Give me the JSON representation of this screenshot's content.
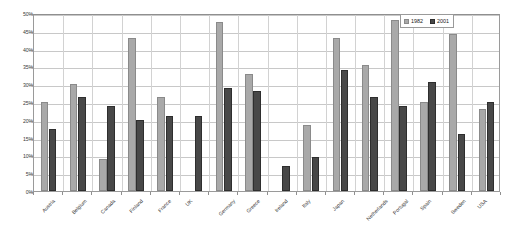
{
  "chart_data": {
    "type": "bar",
    "title": "",
    "subtitle": "",
    "xlabel": "",
    "ylabel": "",
    "ylim": [
      0,
      50
    ],
    "ytick_step": 5,
    "ytick_labels": [
      "0%",
      "5%",
      "10%",
      "15%",
      "20%",
      "25%",
      "30%",
      "35%",
      "40%",
      "45%",
      "50%"
    ],
    "grid": true,
    "legend_position": "top-right",
    "categories": [
      "Austria",
      "Belgium",
      "Canada",
      "Finland",
      "France",
      "UK",
      "Germany",
      "Greece",
      "Ireland",
      "Italy",
      "Japan",
      "Netherlands",
      "Portugal",
      "Spain",
      "Sweden",
      "USA"
    ],
    "series": [
      {
        "name": "1982",
        "color": "#a9a9a9",
        "values": [
          25,
          30,
          9,
          43,
          26.5,
          null,
          47.5,
          33,
          null,
          18.5,
          43,
          35.5,
          48,
          25,
          44,
          23
        ]
      },
      {
        "name": "2001",
        "color": "#484848",
        "values": [
          17.5,
          26.5,
          24,
          20,
          21,
          21,
          29,
          28,
          7,
          9.5,
          34,
          26.5,
          24,
          30.5,
          16,
          25
        ]
      }
    ]
  },
  "legend": {
    "entries": [
      {
        "label": "1982"
      },
      {
        "label": "2001"
      }
    ]
  }
}
